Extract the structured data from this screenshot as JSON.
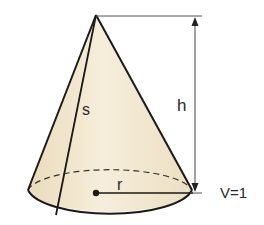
{
  "figure": {
    "type": "cone",
    "colors": {
      "fill": "#f3e9d2",
      "outline": "#1a1a1a",
      "dimension_line": "#333333",
      "background": "#ffffff"
    },
    "labels": {
      "slant_height": "s",
      "height": "h",
      "radius": "r",
      "volume": "V=1"
    }
  }
}
